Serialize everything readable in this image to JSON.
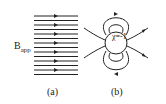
{
  "figure": {
    "panel_a": {
      "label": "B",
      "label_sub": "app",
      "caption": "(a)",
      "field_lines": 14
    },
    "panel_b": {
      "material_label": "χ=-1",
      "caption": "(b)"
    }
  }
}
